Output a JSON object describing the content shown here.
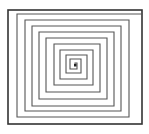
{
  "diagram": {
    "type": "square-spiral",
    "stroke_color": "#555555",
    "frame_color": "#333333",
    "frame": {
      "x": 8,
      "y": 10,
      "w": 134,
      "h": 114
    },
    "spiral_points": [
      [
        75,
        66
      ],
      [
        75,
        63
      ],
      [
        77,
        63
      ],
      [
        77,
        69
      ],
      [
        70,
        69
      ],
      [
        70,
        59
      ],
      [
        81,
        59
      ],
      [
        81,
        73
      ],
      [
        66,
        73
      ],
      [
        66,
        55
      ],
      [
        87,
        55
      ],
      [
        87,
        79
      ],
      [
        60,
        79
      ],
      [
        60,
        50
      ],
      [
        93,
        50
      ],
      [
        93,
        85
      ],
      [
        54,
        85
      ],
      [
        54,
        44
      ],
      [
        100,
        44
      ],
      [
        100,
        92
      ],
      [
        46,
        92
      ],
      [
        46,
        38
      ],
      [
        107,
        38
      ],
      [
        107,
        99
      ],
      [
        39,
        99
      ],
      [
        39,
        32
      ],
      [
        114,
        32
      ],
      [
        114,
        106
      ],
      [
        32,
        106
      ],
      [
        32,
        26
      ],
      [
        121,
        26
      ],
      [
        121,
        111
      ],
      [
        25,
        111
      ],
      [
        25,
        20
      ],
      [
        129,
        20
      ],
      [
        129,
        117
      ],
      [
        17,
        117
      ],
      [
        17,
        14
      ],
      [
        142,
        14
      ]
    ]
  }
}
